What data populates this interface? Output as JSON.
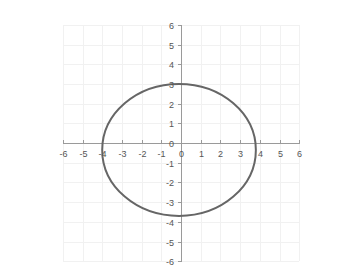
{
  "chart_data": {
    "type": "line",
    "title": "",
    "subtitle": "",
    "xlabel": "",
    "ylabel": "",
    "xlim": [
      -6,
      6
    ],
    "ylim": [
      -6,
      6
    ],
    "grid": true,
    "legend": null,
    "legend_position": "none",
    "x_ticks": [
      -6,
      -5,
      -4,
      -3,
      -2,
      -1,
      0,
      1,
      2,
      3,
      4,
      5,
      6
    ],
    "y_ticks": [
      -6,
      -5,
      -4,
      -3,
      -2,
      -1,
      0,
      1,
      2,
      3,
      4,
      5,
      6
    ],
    "x_tick_labels": [
      "-6",
      "-5",
      "-4",
      "-3",
      "-2",
      "-1",
      "0",
      "1",
      "2",
      "3",
      "4",
      "5",
      "6"
    ],
    "y_tick_labels": [
      "-6",
      "-5",
      "-4",
      "-3",
      "-2",
      "-1",
      "0",
      "1",
      "2",
      "3",
      "4",
      "5",
      "6"
    ],
    "axis_color": "#9a9a9a",
    "grid_color": "#f1f1f1",
    "label_color": "#555555",
    "background_color": "#ffffff",
    "series": [
      {
        "name": "ellipse",
        "shape": "ellipse",
        "color": "#666666",
        "line_width": 2,
        "center_x": -0.1,
        "center_y": -0.35,
        "semi_axis_x": 3.9,
        "semi_axis_y": 3.35,
        "leftmost_x": -4.0,
        "rightmost_x": 3.8,
        "topmost_y": 3.0,
        "bottommost_y": -3.7,
        "annotation": "x-intercepts at approximately -4.0 and 3.8; y-intercepts at approximately 3.0 and -3.7"
      }
    ]
  },
  "geometry": {
    "width": 362,
    "height": 278,
    "origin_x_px": 181,
    "origin_y_px": 143,
    "unit_px": 19.7,
    "tick_len_px": 4
  }
}
